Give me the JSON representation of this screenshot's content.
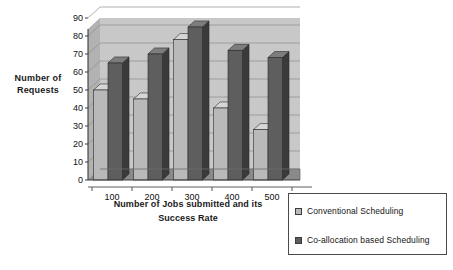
{
  "chart_data": {
    "type": "bar",
    "title": "",
    "subtitle": "",
    "xlabel": "Number of Jobs submitted and its Success Rate",
    "ylabel": "Number of Requests",
    "categories": [
      "100",
      "200",
      "300",
      "400",
      "500"
    ],
    "series": [
      {
        "name": "Conventional Scheduling",
        "color": "#b9b9b9",
        "side_color": "#8f8f8f",
        "top_color": "#d6d6d6",
        "values": [
          50,
          45,
          78,
          40,
          28
        ]
      },
      {
        "name": "Co-allocation based Scheduling",
        "color": "#5e5e5e",
        "side_color": "#3a3a3a",
        "top_color": "#7d7d7d",
        "values": [
          65,
          70,
          85,
          72,
          68
        ]
      }
    ],
    "ylim": [
      0,
      90
    ],
    "ytick_step": 10,
    "yticks": [
      "0",
      "10",
      "20",
      "30",
      "40",
      "50",
      "60",
      "70",
      "80",
      "90"
    ],
    "grid": true,
    "legend_position": "bottom-right",
    "style": "3d-column",
    "plot_bg_color": "#c8c8c8",
    "floor_color": "#8a8a8a",
    "axis_color": "#3c3c3c"
  },
  "y_axis_title_lines": [
    "Number of",
    "Requests"
  ],
  "x_axis_title_lines": [
    "Number of Jobs submitted and its",
    "Success Rate"
  ],
  "legend": {
    "items": [
      {
        "label": "Conventional Scheduling"
      },
      {
        "label": "Co-allocation based Scheduling"
      }
    ]
  }
}
